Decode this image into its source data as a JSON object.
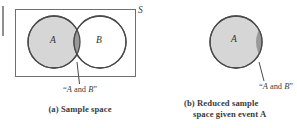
{
  "figure": {
    "type": "venn-diagram",
    "background": "#ffffff",
    "panels": [
      {
        "id": "a",
        "caption": "(a)  Sample space",
        "sample_space_label": "S",
        "intersection_label": "“A and B”",
        "intersection_label_parts": {
          "open_quote": "“",
          "a": "A",
          "and": " and ",
          "b": "B",
          "close_quote": "”"
        },
        "sets": [
          {
            "name": "A",
            "label": "A",
            "fill": "#d6d6d6",
            "stroke": "#4a4a4a",
            "shaded": true
          },
          {
            "name": "B",
            "label": "B",
            "fill": "#ffffff",
            "stroke": "#4a4a4a",
            "shaded": false
          }
        ],
        "intersection_fill": "#9a9a9a",
        "rect_stroke": "#6f6f6f"
      },
      {
        "id": "b",
        "caption_line1": "(b)  Reduced sample",
        "caption_line2": "space given event A",
        "intersection_label": "“A and B”",
        "intersection_label_parts": {
          "open_quote": "“",
          "a": "A",
          "and": " and ",
          "b": "B",
          "close_quote": "”"
        },
        "sets": [
          {
            "name": "A",
            "label": "A",
            "fill": "#d6d6d6",
            "stroke": "#4a4a4a",
            "shaded": true
          }
        ],
        "intersection_fill": "#9a9a9a"
      }
    ],
    "colors": {
      "set_fill_light": "#d6d6d6",
      "intersection_gray": "#9a9a9a",
      "circle_stroke": "#4a4a4a",
      "rect_stroke": "#6f6f6f",
      "leader_line": "#4a4a4a",
      "text": "#3c3c3c",
      "edge_mark": "#8e8e8e"
    }
  }
}
